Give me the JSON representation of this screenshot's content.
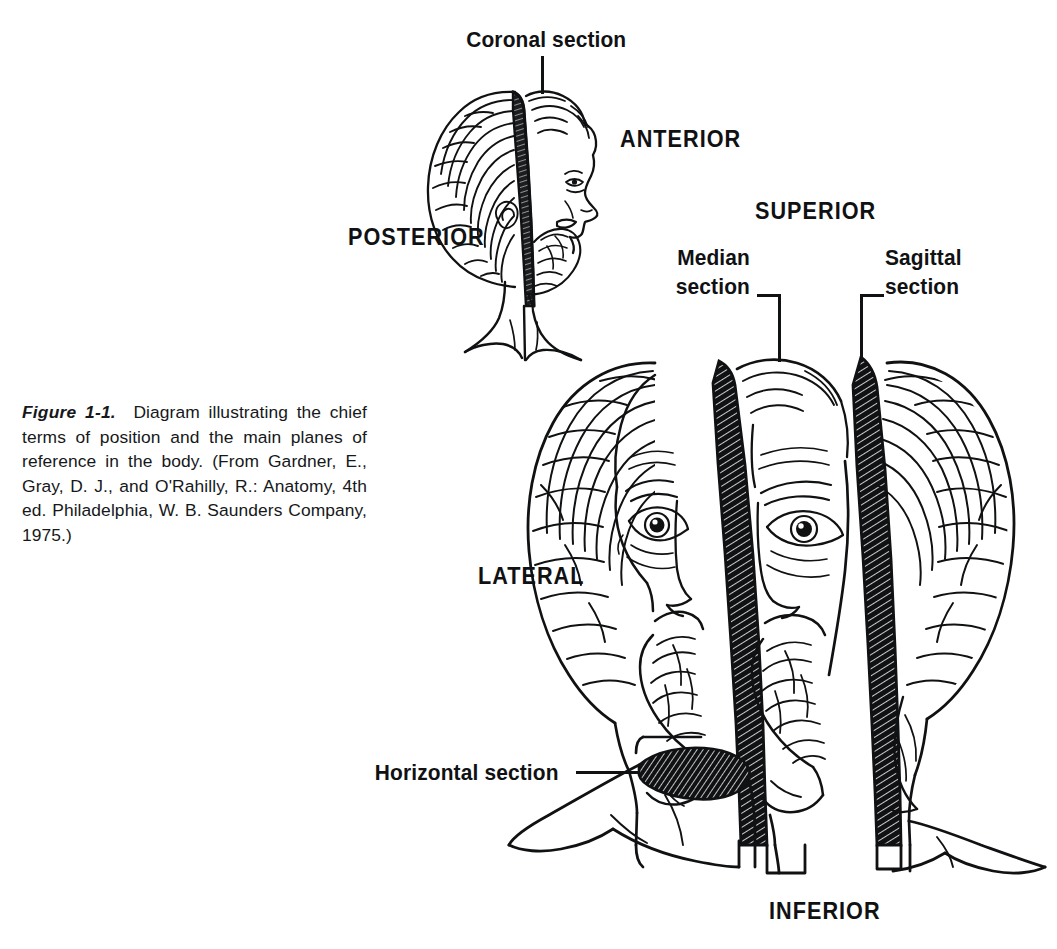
{
  "figure": {
    "number_label": "Figure 1-1.",
    "caption_text": "Diagram illustrating the chief terms of position and the main planes of reference in the body. (From Gardner, E., Gray, D. J., and O'Rahilly, R.: Anatomy, 4th ed. Philadelphia, W. B. Saunders Company, 1975.)",
    "background_color": "#ffffff",
    "ink_color": "#101113"
  },
  "labels": {
    "coronal_section": "Coronal section",
    "anterior": "ANTERIOR",
    "posterior": "POSTERIOR",
    "superior": "SUPERIOR",
    "median_section_line1": "Median",
    "median_section_line2": "section",
    "sagittal_section_line1": "Sagittal",
    "sagittal_section_line2": "section",
    "lateral": "LATERAL",
    "horizontal_section": "Horizontal section",
    "inferior": "INFERIOR"
  },
  "diagram": {
    "upper_figure_name": "profile-head-with-coronal-plane",
    "lower_figure_name": "frontal-head-with-sagittal-and-median-planes",
    "planes": [
      {
        "name": "coronal",
        "orientation": "vertical-frontal",
        "figure": "profile-head"
      },
      {
        "name": "median",
        "orientation": "vertical-midsagittal",
        "figure": "frontal-head"
      },
      {
        "name": "sagittal",
        "orientation": "vertical-parasagittal",
        "figure": "frontal-head"
      },
      {
        "name": "horizontal",
        "orientation": "transverse",
        "figure": "frontal-head"
      }
    ],
    "axes": [
      {
        "name": "anterior",
        "figure": "profile-head"
      },
      {
        "name": "posterior",
        "figure": "profile-head"
      },
      {
        "name": "superior",
        "figure": "frontal-head"
      },
      {
        "name": "inferior",
        "figure": "frontal-head"
      },
      {
        "name": "lateral",
        "figure": "frontal-head"
      }
    ]
  }
}
